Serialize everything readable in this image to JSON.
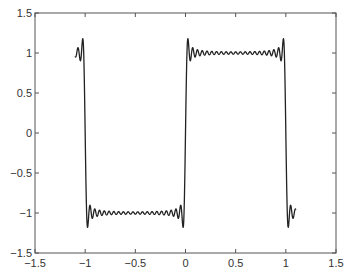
{
  "chart_data": {
    "type": "line",
    "title": "",
    "xlabel": "",
    "ylabel": "",
    "xlim": [
      -1.5,
      1.5
    ],
    "ylim": [
      -1.5,
      1.5
    ],
    "grid": false,
    "legend": null,
    "x_ticks": [
      -1.5,
      -1,
      -0.5,
      0,
      0.5,
      1,
      1.5
    ],
    "x_tick_labels": [
      "-1.5",
      "-1",
      "-0.5",
      "0",
      "0.5",
      "1",
      "1.5"
    ],
    "y_ticks": [
      -1.5,
      -1,
      -0.5,
      0,
      0.5,
      1,
      1.5
    ],
    "y_tick_labels": [
      "-1.5",
      "-1",
      "-0.5",
      "0",
      "0.5",
      "1",
      "1.5"
    ],
    "series": [
      {
        "name": "Fourier partial sum of square wave (Gibbs phenomenon)",
        "description": "Square wave of period 2: +1 on (0,1), -1 on (-1,0); partial Fourier sum with overshoot ~1.18 at discontinuities x=-1,0,1",
        "x_range": [
          -1.1,
          1.1
        ],
        "harmonics": 41,
        "color": "#222222",
        "key_points": [
          {
            "x": -1.1,
            "y": 1.0
          },
          {
            "x": -1.02,
            "y": 1.15
          },
          {
            "x": -1.0,
            "y": 0.0
          },
          {
            "x": -0.98,
            "y": -1.15
          },
          {
            "x": -0.5,
            "y": -1.0
          },
          {
            "x": -0.02,
            "y": -1.15
          },
          {
            "x": 0.0,
            "y": 0.0
          },
          {
            "x": 0.02,
            "y": 1.15
          },
          {
            "x": 0.5,
            "y": 1.0
          },
          {
            "x": 0.98,
            "y": 1.15
          },
          {
            "x": 1.0,
            "y": 0.0
          },
          {
            "x": 1.02,
            "y": -1.15
          },
          {
            "x": 1.1,
            "y": -1.0
          }
        ]
      }
    ]
  },
  "colors": {
    "axes": "#555555",
    "line": "#222222",
    "background": "#ffffff"
  }
}
